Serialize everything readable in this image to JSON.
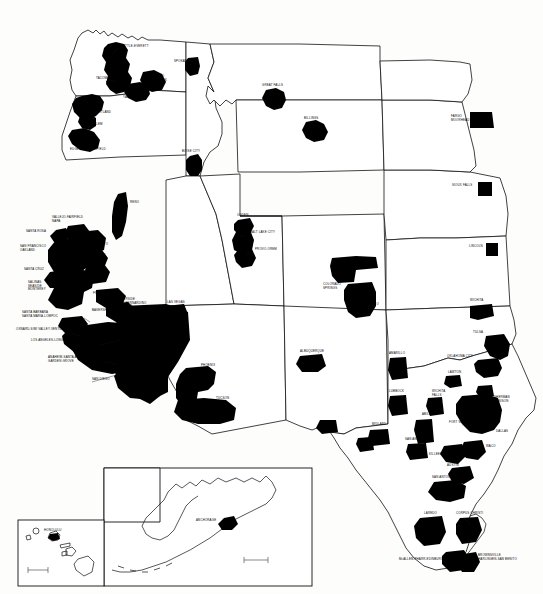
{
  "document": {
    "type": "map",
    "title": "Metropolitan Areas of the Western United States",
    "description": "Black and white line map showing state boundaries of the western United States with metropolitan statistical areas shaded solid black, including inset maps of Alaska and Hawaii.",
    "background_color": "#fdfdfb",
    "land_color": "#ffffff",
    "metro_fill_color": "#000000",
    "boundary_color": "#111111"
  },
  "insets": [
    {
      "name": "alaska-inset",
      "label": ""
    },
    {
      "name": "hawaii-inset",
      "label": ""
    }
  ],
  "metros": [
    {
      "id": "seattle-everett",
      "label": "SEATTLE-EVERETT",
      "x": 119,
      "y": 47,
      "anchor": "start"
    },
    {
      "id": "tacoma",
      "label": "TACOMA",
      "x": 96,
      "y": 79,
      "anchor": "start"
    },
    {
      "id": "spokane",
      "label": "SPOKANE",
      "x": 174,
      "y": 62,
      "anchor": "start"
    },
    {
      "id": "richland-kennewick",
      "label": "RICHLAND\nKENNEWICK",
      "x": 148,
      "y": 77,
      "anchor": "start"
    },
    {
      "id": "yakima",
      "label": "YAKIMA",
      "x": 123,
      "y": 98,
      "anchor": "start"
    },
    {
      "id": "portland",
      "label": "PORTLAND",
      "x": 94,
      "y": 113,
      "anchor": "start"
    },
    {
      "id": "salem",
      "label": "SALEM",
      "x": 92,
      "y": 125,
      "anchor": "start"
    },
    {
      "id": "eugene-springfield",
      "label": "EUGENE-SPRINGFIELD",
      "x": 70,
      "y": 150,
      "anchor": "start"
    },
    {
      "id": "great-falls",
      "label": "GREAT FALLS",
      "x": 262,
      "y": 86,
      "anchor": "start"
    },
    {
      "id": "billings",
      "label": "BILLINGS",
      "x": 304,
      "y": 119,
      "anchor": "start"
    },
    {
      "id": "fargo-moorhead",
      "label": "FARGO\nMOORHEAD",
      "x": 451,
      "y": 117,
      "anchor": "start"
    },
    {
      "id": "sioux-falls",
      "label": "SIOUX FALLS",
      "x": 452,
      "y": 186,
      "anchor": "start"
    },
    {
      "id": "lincoln",
      "label": "LINCOLN",
      "x": 469,
      "y": 247,
      "anchor": "start"
    },
    {
      "id": "boise-city",
      "label": "BOISE CITY",
      "x": 182,
      "y": 152,
      "anchor": "start"
    },
    {
      "id": "reno",
      "label": "RENO",
      "x": 130,
      "y": 203,
      "anchor": "start"
    },
    {
      "id": "ogden",
      "label": "OGDEN",
      "x": 237,
      "y": 216,
      "anchor": "start"
    },
    {
      "id": "salt-lake-city",
      "label": "SALT LAKE CITY",
      "x": 250,
      "y": 233,
      "anchor": "start"
    },
    {
      "id": "provo-orem",
      "label": "PROVO-OREM",
      "x": 255,
      "y": 250,
      "anchor": "start"
    },
    {
      "id": "denver",
      "label": "DENVER",
      "x": 356,
      "y": 262,
      "anchor": "start"
    },
    {
      "id": "colorado-springs",
      "label": "COLORADO\nSPRINGS",
      "x": 323,
      "y": 285,
      "anchor": "start"
    },
    {
      "id": "pueblo",
      "label": "PUEBLO",
      "x": 366,
      "y": 305,
      "anchor": "start"
    },
    {
      "id": "wichita",
      "label": "WICHITA",
      "x": 470,
      "y": 301,
      "anchor": "start"
    },
    {
      "id": "tulsa",
      "label": "TULSA",
      "x": 473,
      "y": 333,
      "anchor": "start"
    },
    {
      "id": "oklahoma-city",
      "label": "OKLAHOMA CITY",
      "x": 447,
      "y": 357,
      "anchor": "start"
    },
    {
      "id": "lawton",
      "label": "LAWTON",
      "x": 448,
      "y": 373,
      "anchor": "start"
    },
    {
      "id": "sherman-denison",
      "label": "SHERMAN\nDENISON",
      "x": 494,
      "y": 398,
      "anchor": "start"
    },
    {
      "id": "dallas",
      "label": "DALLAS",
      "x": 496,
      "y": 432,
      "anchor": "start"
    },
    {
      "id": "fort-worth",
      "label": "FORT WORTH",
      "x": 449,
      "y": 423,
      "anchor": "start"
    },
    {
      "id": "waco",
      "label": "WACO",
      "x": 486,
      "y": 447,
      "anchor": "start"
    },
    {
      "id": "killeen-temple",
      "label": "KILLEEN-TEMPLE",
      "x": 429,
      "y": 455,
      "anchor": "start"
    },
    {
      "id": "austin",
      "label": "AUSTIN",
      "x": 447,
      "y": 466,
      "anchor": "start"
    },
    {
      "id": "san-antonio",
      "label": "SAN ANTONIO",
      "x": 432,
      "y": 478,
      "anchor": "start"
    },
    {
      "id": "wichita-falls",
      "label": "WICHITA\nFALLS",
      "x": 432,
      "y": 392,
      "anchor": "start"
    },
    {
      "id": "abilene",
      "label": "ABILENE",
      "x": 422,
      "y": 415,
      "anchor": "start"
    },
    {
      "id": "amarillo",
      "label": "AMARILLO",
      "x": 389,
      "y": 354,
      "anchor": "start"
    },
    {
      "id": "lubbock",
      "label": "LUBBOCK",
      "x": 389,
      "y": 392,
      "anchor": "start"
    },
    {
      "id": "midland",
      "label": "MIDLAND",
      "x": 372,
      "y": 425,
      "anchor": "start"
    },
    {
      "id": "odessa",
      "label": "ODESSA",
      "x": 365,
      "y": 440,
      "anchor": "start"
    },
    {
      "id": "san-angelo",
      "label": "SAN ANGELO",
      "x": 405,
      "y": 440,
      "anchor": "start"
    },
    {
      "id": "el-paso",
      "label": "EL PASO",
      "x": 321,
      "y": 432,
      "anchor": "start"
    },
    {
      "id": "laredo",
      "label": "LAREDO",
      "x": 424,
      "y": 514,
      "anchor": "start"
    },
    {
      "id": "corpus-christi",
      "label": "CORPUS CHRISTI",
      "x": 456,
      "y": 514,
      "anchor": "start"
    },
    {
      "id": "mcallen-pharr-edinburg",
      "label": "McALLEN-PHARR-EDINBURG",
      "x": 399,
      "y": 560,
      "anchor": "start"
    },
    {
      "id": "brownsville-harlingen",
      "label": "BROWNSVILLE\nHARLINGEN-SAN BENITO",
      "x": 478,
      "y": 556,
      "anchor": "start"
    },
    {
      "id": "albuquerque",
      "label": "ALBUQUERQUE",
      "x": 300,
      "y": 352,
      "anchor": "start"
    },
    {
      "id": "phoenix",
      "label": "PHOENIX",
      "x": 201,
      "y": 366,
      "anchor": "start"
    },
    {
      "id": "tucson",
      "label": "TUCSON",
      "x": 216,
      "y": 399,
      "anchor": "start"
    },
    {
      "id": "las-vegas",
      "label": "LAS VEGAS",
      "x": 167,
      "y": 303,
      "anchor": "start"
    },
    {
      "id": "vallejo-fairfield-napa",
      "label": "VALLEJO-FAIRFIELD\nNAPA",
      "x": 52,
      "y": 218,
      "anchor": "start"
    },
    {
      "id": "santa-rosa",
      "label": "SANTA ROSA",
      "x": 26,
      "y": 232,
      "anchor": "start"
    },
    {
      "id": "san-francisco-oakland",
      "label": "SAN FRANCISCO\nOAKLAND",
      "x": 20,
      "y": 247,
      "anchor": "start"
    },
    {
      "id": "sacramento",
      "label": "SACRAMENTO",
      "x": 86,
      "y": 245,
      "anchor": "start"
    },
    {
      "id": "stockton",
      "label": "STOCKTON",
      "x": 88,
      "y": 256,
      "anchor": "start"
    },
    {
      "id": "modesto",
      "label": "MODESTO",
      "x": 88,
      "y": 270,
      "anchor": "start"
    },
    {
      "id": "santa-cruz",
      "label": "SANTA CRUZ",
      "x": 24,
      "y": 270,
      "anchor": "start"
    },
    {
      "id": "san-jose",
      "label": "SAN JOSE",
      "x": 73,
      "y": 280,
      "anchor": "start"
    },
    {
      "id": "salinas-seaside-monterey",
      "label": "SALINAS\nSEASIDE\nMONTEREY",
      "x": 28,
      "y": 283,
      "anchor": "start"
    },
    {
      "id": "fresno",
      "label": "FRESNO",
      "x": 93,
      "y": 294,
      "anchor": "start"
    },
    {
      "id": "bakersfield",
      "label": "BAKERSFIELD",
      "x": 92,
      "y": 311,
      "anchor": "start"
    },
    {
      "id": "riverside-san-bernardino",
      "label": "RIVERSIDE\nSAN BERNARDINO\nONTARIO",
      "x": 118,
      "y": 300,
      "anchor": "start"
    },
    {
      "id": "santa-barbara",
      "label": "SANTA BARBARA\nSANTA MARIA-LOMPOC",
      "x": 22,
      "y": 313,
      "anchor": "start"
    },
    {
      "id": "oxnard-ventura",
      "label": "OXNARD-SIMI VALLEY-VENTURA",
      "x": 16,
      "y": 330,
      "anchor": "start"
    },
    {
      "id": "los-angeles-long-beach",
      "label": "LOS ANGELES-LONG BEACH",
      "x": 31,
      "y": 341,
      "anchor": "start"
    },
    {
      "id": "anaheim-santa-ana",
      "label": "ANAHEIM-SANTA ANA\nGARDEN GROVE",
      "x": 48,
      "y": 358,
      "anchor": "start"
    },
    {
      "id": "san-diego",
      "label": "SAN DIEGO",
      "x": 92,
      "y": 380,
      "anchor": "start"
    },
    {
      "id": "anchorage",
      "label": "ANCHORAGE",
      "x": 196,
      "y": 521,
      "anchor": "start"
    },
    {
      "id": "honolulu",
      "label": "HONOLULU",
      "x": 44,
      "y": 531,
      "anchor": "start"
    }
  ]
}
